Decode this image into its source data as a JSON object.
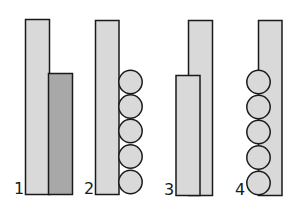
{
  "colors": {
    "background": "#ffffff",
    "light_fill": "#d9d9d9",
    "dark_fill": "#a8a8a8",
    "stroke": "#1a1a1a"
  },
  "figures": [
    {
      "label": "1",
      "description": "tall light bar with shorter dark bar beside it"
    },
    {
      "label": "2",
      "description": "tall light bar with five stacked circles on right"
    },
    {
      "label": "3",
      "description": "tall light bar with shorter light bar in front on left"
    },
    {
      "label": "4",
      "description": "tall light bar with five stacked circles overlapping on left"
    }
  ]
}
